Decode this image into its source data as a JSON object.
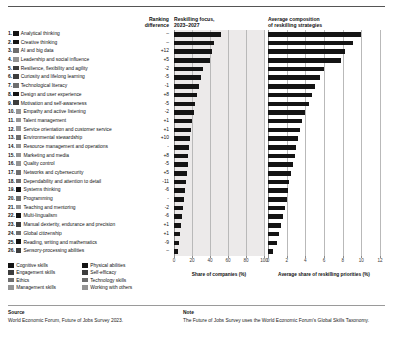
{
  "header": {
    "ranking_difference": "Ranking\ndifference",
    "ranking_difference_l1": "Ranking",
    "ranking_difference_l2": "difference",
    "reskilling_focus_l1": "Reskilling focus,",
    "reskilling_focus_l2": "2023–2027",
    "composition_l1": "Average composition",
    "composition_l2": "of reskilling strategies"
  },
  "legend": {
    "col1": [
      {
        "label": "Cognitive skills",
        "color": "#141414"
      },
      {
        "label": "Engagement skills",
        "color": "#3d3d3d"
      },
      {
        "label": "Ethics",
        "color": "#6e6e6e"
      },
      {
        "label": "Management skills",
        "color": "#949494"
      }
    ],
    "col2": [
      {
        "label": "Physical abilities",
        "color": "#141414"
      },
      {
        "label": "Self-efficacy",
        "color": "#3d3d3d"
      },
      {
        "label": "Technology skills",
        "color": "#6e6e6e"
      },
      {
        "label": "Working with others",
        "color": "#949494"
      }
    ]
  },
  "footer": {
    "source_title": "Source",
    "source_text": "World Economic Forum, Future of Jobs Survey 2023.",
    "note_title": "Note",
    "note_text": "The Future of Jobs Survey uses the World Economic Forum's Global Skills Taxonomy."
  },
  "chart_data": {
    "type": "bar",
    "categories": [
      "Analytical thinking",
      "Creative thinking",
      "AI and big data",
      "Leadership and social influence",
      "Resilience, flexibility and agility",
      "Curiosity and lifelong learning",
      "Technological literacy",
      "Design and user experience",
      "Motivation and self-awareness",
      "Empathy and active listening",
      "Talent management",
      "Service orientation and customer service",
      "Environmental stewardship",
      "Resource management and operations",
      "Marketing and media",
      "Quality control",
      "Networks and cybersecurity",
      "Dependability and attention to detail",
      "Systems thinking",
      "Programming",
      "Teaching and mentoring",
      "Multi-lingualism",
      "Manual dexterity, endurance and precision",
      "Global citizenship",
      "Reading, writing and mathematics",
      "Sensory-processing abilities"
    ],
    "ranks": [
      "1.",
      "2.",
      "3.",
      "4.",
      "5.",
      "6.",
      "7.",
      "8.",
      "9.",
      "10.",
      "11.",
      "12.",
      "13.",
      "14.",
      "15.",
      "16.",
      "17.",
      "18.",
      "19.",
      "20.",
      "21.",
      "22.",
      "23.",
      "24.",
      "25.",
      "26."
    ],
    "ranking_difference": [
      "–",
      "–",
      "+12",
      "+5",
      "-2",
      "-5",
      "-1",
      "+8",
      "-5",
      "-2",
      "+1",
      "+1",
      "+10",
      "-",
      "+8",
      "-5",
      "+5",
      "-11",
      "-6",
      "-",
      "-2",
      "-6",
      "+1",
      "+1",
      "-9",
      "–"
    ],
    "skill_groups": [
      "cognitive",
      "cognitive",
      "technology",
      "working-with-others",
      "self-efficacy",
      "self-efficacy",
      "technology",
      "cognitive",
      "self-efficacy",
      "working-with-others",
      "management",
      "working-with-others",
      "ethics",
      "management",
      "management",
      "management",
      "technology",
      "ethics",
      "cognitive",
      "technology",
      "working-with-others",
      "cognitive",
      "physical",
      "ethics",
      "cognitive",
      "physical"
    ],
    "swatch_colors": [
      "#141414",
      "#141414",
      "#6e6e6e",
      "#949494",
      "#3d3d3d",
      "#3d3d3d",
      "#6e6e6e",
      "#141414",
      "#3d3d3d",
      "#949494",
      "#949494",
      "#949494",
      "#6e6e6e",
      "#949494",
      "#949494",
      "#949494",
      "#6e6e6e",
      "#6e6e6e",
      "#141414",
      "#6e6e6e",
      "#949494",
      "#141414",
      "#3d3d3d",
      "#6e6e6e",
      "#141414",
      "#3d3d3d"
    ],
    "chart1": {
      "name": "Reskilling focus, 2023–2027",
      "xlabel": "Share of companies (%)",
      "xticks": [
        0,
        20,
        40,
        60,
        80,
        100
      ],
      "xlim": [
        0,
        100
      ],
      "unit": "%",
      "values": [
        52,
        44,
        42,
        40,
        32,
        30,
        28,
        25,
        23,
        22,
        20,
        19,
        18,
        17,
        16,
        15,
        14,
        13,
        12,
        11,
        10,
        9,
        8,
        7,
        6,
        4
      ]
    },
    "chart2": {
      "name": "Average composition of reskilling strategies",
      "xlabel": "Average share of reskilling priorities (%)",
      "xticks": [
        0,
        2,
        4,
        6,
        8,
        10,
        12
      ],
      "xlim": [
        0,
        12
      ],
      "unit": "%",
      "values": [
        10.0,
        9.1,
        8.2,
        7.8,
        6.0,
        5.6,
        5.0,
        4.7,
        4.4,
        4.0,
        3.6,
        3.4,
        3.2,
        3.0,
        2.9,
        2.7,
        2.5,
        2.3,
        2.1,
        2.0,
        1.8,
        1.6,
        1.4,
        1.2,
        1.0,
        0.5
      ]
    }
  }
}
